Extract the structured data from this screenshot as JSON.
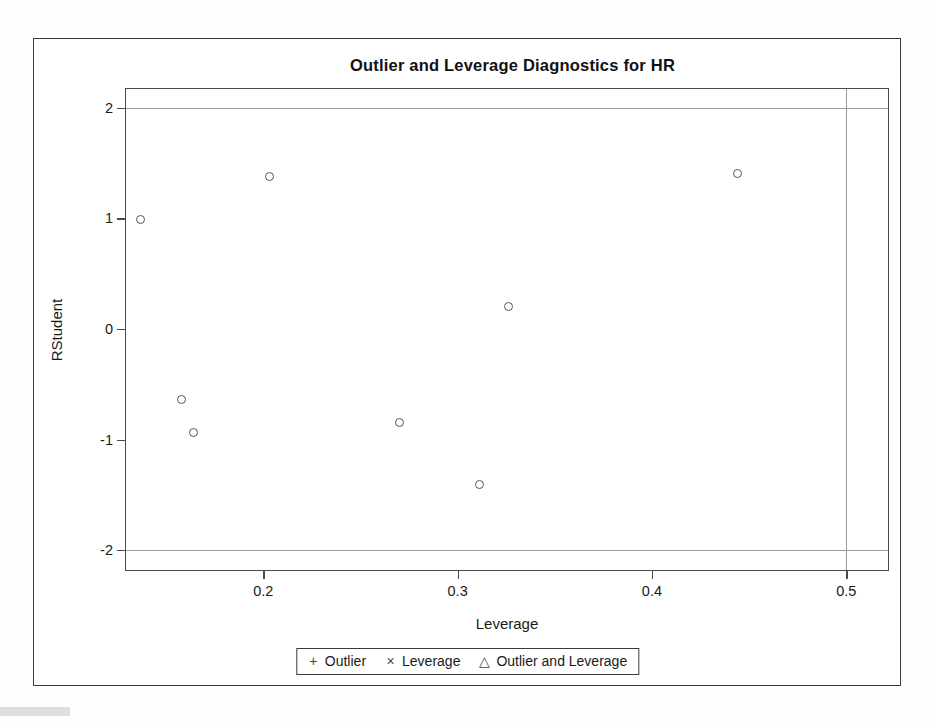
{
  "figure": {
    "title": "Outlier and Leverage Diagnostics for HR",
    "x_axis_title": "Leverage",
    "y_axis_title": "RStudent"
  },
  "legend": {
    "items": [
      {
        "symbol": "+",
        "symbol_name": "plus-marker",
        "label": "Outlier"
      },
      {
        "symbol": "×",
        "symbol_name": "cross-marker",
        "label": "Leverage"
      },
      {
        "symbol": "△",
        "symbol_name": "triangle-marker",
        "label": "Outlier and Leverage"
      }
    ]
  },
  "chart_data": {
    "type": "scatter",
    "title": "Outlier and Leverage Diagnostics for HR",
    "xlabel": "Leverage",
    "ylabel": "RStudent",
    "xlim": [
      0.1293,
      0.5215
    ],
    "ylim": [
      -2.18,
      2.17
    ],
    "xticks": [
      0.2,
      0.3,
      0.4,
      0.5
    ],
    "xtick_labels": [
      "0.2",
      "0.3",
      "0.4",
      "0.5"
    ],
    "yticks": [
      2,
      1,
      0,
      -1,
      -2
    ],
    "ytick_labels": [
      "2",
      "1",
      "0",
      "-1",
      "-2"
    ],
    "grid": false,
    "legend_position": "bottom-center",
    "marker": "open-circle",
    "reference_lines": [
      {
        "orientation": "horizontal",
        "value": 2,
        "name": "rstudent-upper-cutoff"
      },
      {
        "orientation": "horizontal",
        "value": -2,
        "name": "rstudent-lower-cutoff"
      },
      {
        "orientation": "vertical",
        "value": 0.5,
        "name": "leverage-cutoff"
      }
    ],
    "points": [
      {
        "x": 0.137,
        "y": 0.99
      },
      {
        "x": 0.158,
        "y": -0.64
      },
      {
        "x": 0.164,
        "y": -0.94
      },
      {
        "x": 0.203,
        "y": 1.38
      },
      {
        "x": 0.27,
        "y": -0.85
      },
      {
        "x": 0.311,
        "y": -1.41
      },
      {
        "x": 0.326,
        "y": 0.2
      },
      {
        "x": 0.444,
        "y": 1.41
      }
    ],
    "series": [
      {
        "name": "observations",
        "x": [
          0.137,
          0.158,
          0.164,
          0.203,
          0.27,
          0.311,
          0.326,
          0.444
        ],
        "y": [
          0.99,
          -0.64,
          -0.94,
          1.38,
          -0.85,
          -1.41,
          0.2,
          1.41
        ]
      }
    ]
  },
  "colors": {
    "frame": "#3a3a3a",
    "axis": "#4a4a4a",
    "marker": "#555555",
    "reference_line": "#9a9a9a",
    "text": "#1a1a1a",
    "background": "#ffffff"
  }
}
